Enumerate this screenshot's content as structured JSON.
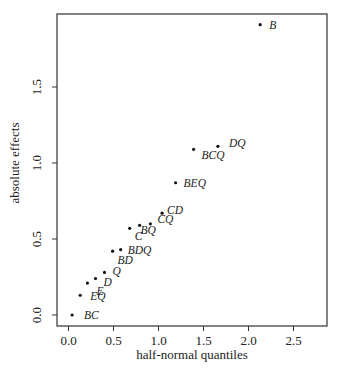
{
  "chart_data": {
    "type": "scatter",
    "title": "",
    "xlabel": "half-normal quantiles",
    "ylabel": "absolute effects",
    "xlim": [
      -0.1,
      2.85
    ],
    "ylim": [
      -0.08,
      1.97
    ],
    "xticks": [
      0.0,
      0.5,
      1.0,
      1.5,
      2.0,
      2.5
    ],
    "xtick_labels": [
      "0.0",
      "0.5",
      "1.0",
      "1.5",
      "2.0",
      "2.5"
    ],
    "yticks": [
      0.0,
      0.5,
      1.0,
      1.5
    ],
    "ytick_labels": [
      "0.0",
      "0.5",
      "1.0",
      "1.5"
    ],
    "grid": false,
    "legend": null,
    "points": [
      {
        "label": "BC",
        "x": 0.04,
        "y": 0.0,
        "dx": 12,
        "dy": 4
      },
      {
        "label": "EQ",
        "x": 0.13,
        "y": 0.13,
        "dx": 10,
        "dy": 5
      },
      {
        "label": "E",
        "x": 0.21,
        "y": 0.21,
        "dx": 9,
        "dy": 12
      },
      {
        "label": "D",
        "x": 0.3,
        "y": 0.24,
        "dx": 8,
        "dy": 7
      },
      {
        "label": "Q",
        "x": 0.4,
        "y": 0.28,
        "dx": 8,
        "dy": 3
      },
      {
        "label": "BD",
        "x": 0.49,
        "y": 0.42,
        "dx": 5,
        "dy": 13
      },
      {
        "label": "BDQ",
        "x": 0.58,
        "y": 0.43,
        "dx": 7,
        "dy": 4
      },
      {
        "label": "C",
        "x": 0.68,
        "y": 0.57,
        "dx": 5,
        "dy": 12
      },
      {
        "label": "BQ",
        "x": 0.79,
        "y": 0.59,
        "dx": 1,
        "dy": 9
      },
      {
        "label": "CQ",
        "x": 0.91,
        "y": 0.6,
        "dx": 7,
        "dy": -1
      },
      {
        "label": "CD",
        "x": 1.04,
        "y": 0.67,
        "dx": 5,
        "dy": 1
      },
      {
        "label": "BEQ",
        "x": 1.19,
        "y": 0.87,
        "dx": 8,
        "dy": 4
      },
      {
        "label": "BCQ",
        "x": 1.39,
        "y": 1.09,
        "dx": 8,
        "dy": 10
      },
      {
        "label": "DQ",
        "x": 1.66,
        "y": 1.11,
        "dx": 11,
        "dy": 1
      },
      {
        "label": "B",
        "x": 2.13,
        "y": 1.91,
        "dx": 9,
        "dy": 4
      }
    ]
  }
}
